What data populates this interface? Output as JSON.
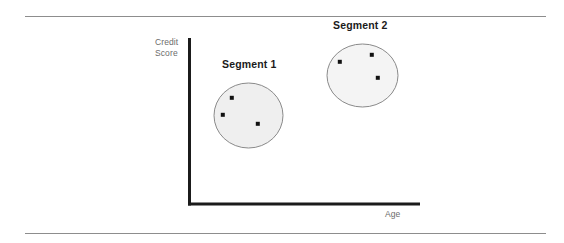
{
  "diagram": {
    "title_visible": false,
    "axes": {
      "y_label": "Credit\nScore",
      "x_label": "Age",
      "axis_color": "#1b1b1b",
      "origin": {
        "x": 188,
        "y": 205
      },
      "y_top": 38,
      "x_right": 420
    },
    "frame_rules": {
      "color": "#8d8d8d",
      "top_y": 16,
      "bottom_y": 233,
      "left_x": 25,
      "width": 521
    },
    "cluster_fill": "#efefef",
    "cluster_stroke": "#8a8a8a",
    "point_color": "#111111",
    "clusters": [
      {
        "label": "Segment 1",
        "cx": 248.5,
        "cy": 115.5,
        "rx": 34.5,
        "ry": 32.5,
        "points": [
          {
            "x": 232,
            "y": 98
          },
          {
            "x": 223,
            "y": 115
          },
          {
            "x": 258,
            "y": 124
          }
        ]
      },
      {
        "label": "Segment 2",
        "cx": 362.5,
        "cy": 75.5,
        "rx": 35.5,
        "ry": 31.5,
        "points": [
          {
            "x": 340,
            "y": 62
          },
          {
            "x": 372,
            "y": 55
          },
          {
            "x": 378,
            "y": 78
          }
        ]
      }
    ]
  }
}
